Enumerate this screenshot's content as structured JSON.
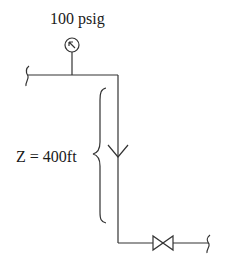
{
  "diagram": {
    "type": "piping-schematic",
    "labels": {
      "pressure": "100 psig",
      "elevation": "Z = 400ft"
    },
    "components": [
      {
        "kind": "pressure-gauge",
        "label": "100 psig"
      },
      {
        "kind": "pipe-break",
        "position": "inlet-left"
      },
      {
        "kind": "pipe",
        "segment": "horizontal-top"
      },
      {
        "kind": "pipe",
        "segment": "vertical-drop"
      },
      {
        "kind": "flow-arrow",
        "direction": "down"
      },
      {
        "kind": "dimension-brace",
        "label": "Z = 400ft"
      },
      {
        "kind": "pipe",
        "segment": "horizontal-bottom"
      },
      {
        "kind": "gate-valve"
      },
      {
        "kind": "pipe-break",
        "position": "outlet-right"
      }
    ],
    "colors": {
      "stroke": "#333333",
      "text": "#1a1a1a",
      "background": "#ffffff"
    }
  }
}
